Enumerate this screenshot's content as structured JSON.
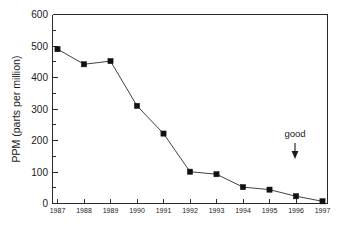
{
  "chart_data": {
    "type": "line",
    "title": "",
    "xlabel": "",
    "ylabel": "PPM (parts per million)",
    "categories": [
      "1987",
      "1988",
      "1989",
      "1990",
      "1991",
      "1992",
      "1993",
      "1994",
      "1995",
      "1996",
      "1997"
    ],
    "x": [
      1987,
      1988,
      1989,
      1990,
      1991,
      1992,
      1993,
      1994,
      1995,
      1996,
      1997
    ],
    "values": [
      490,
      442,
      452,
      310,
      222,
      101,
      93,
      52,
      44,
      23,
      7
    ],
    "series": [
      {
        "name": "PPM",
        "values": [
          490,
          442,
          452,
          310,
          222,
          101,
          93,
          52,
          44,
          23,
          7
        ]
      }
    ],
    "ylim": [
      0,
      600
    ],
    "ytick_labels": [
      "0",
      "100",
      "200",
      "300",
      "400",
      "500",
      "600"
    ],
    "ytick_values": [
      0,
      100,
      200,
      300,
      400,
      500,
      600
    ],
    "xtick_labels": [
      "1987",
      "1988",
      "1989",
      "1990",
      "1991",
      "1992",
      "1993",
      "1994",
      "1995",
      "1996",
      "1997"
    ],
    "grid": false,
    "legend": false,
    "legend_position": "none",
    "marker": "filled-square",
    "line_color": "#2b2b2b",
    "marker_color": "#111111",
    "background_color": "#ffffff",
    "annotations": [
      {
        "text": "good",
        "x": 1996,
        "y": 260,
        "arrow": "down",
        "arrow_direction": "down"
      }
    ]
  },
  "axis": {
    "y_title": "PPM (parts per million)",
    "y_ticks": [
      "600",
      "500",
      "400",
      "300",
      "200",
      "100",
      "0"
    ],
    "x_ticks": [
      "1987",
      "1988",
      "1989",
      "1990",
      "1991",
      "1992",
      "1993",
      "1994",
      "1995",
      "1996",
      "1997"
    ]
  },
  "annotation": {
    "good_label": "good"
  }
}
